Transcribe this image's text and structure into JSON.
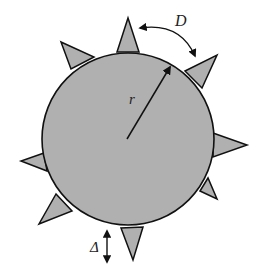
{
  "diagram": {
    "type": "spiked-sphere-schematic",
    "fill_color": "#b0b0b0",
    "stroke_color": "#111111",
    "background": "#ffffff",
    "circle": {
      "cx": 128,
      "cy": 139,
      "r": 86
    },
    "spikes": [
      {
        "name": "spike-top",
        "tip": [
          128,
          18
        ],
        "base": [
          [
            117,
            52
          ],
          [
            139,
            52
          ]
        ]
      },
      {
        "name": "spike-upper-left",
        "tip": [
          61,
          42
        ],
        "base": [
          [
            71,
            69
          ],
          [
            94,
            57
          ]
        ]
      },
      {
        "name": "spike-upper-right",
        "tip": [
          217,
          55
        ],
        "base": [
          [
            185,
            71
          ],
          [
            202,
            88
          ]
        ]
      },
      {
        "name": "spike-right",
        "tip": [
          247,
          145
        ],
        "base": [
          [
            213,
            133
          ],
          [
            213,
            157
          ]
        ]
      },
      {
        "name": "spike-left",
        "tip": [
          21,
          161
        ],
        "base": [
          [
            44,
            153
          ],
          [
            47,
            171
          ]
        ]
      },
      {
        "name": "spike-lower-right",
        "tip": [
          217,
          199
        ],
        "base": [
          [
            200,
            191
          ],
          [
            208,
            178
          ]
        ]
      },
      {
        "name": "spike-lower-left",
        "tip": [
          39,
          224
        ],
        "base": [
          [
            56,
            194
          ],
          [
            72,
            211
          ]
        ]
      },
      {
        "name": "spike-bottom",
        "tip": [
          133,
          260
        ],
        "base": [
          [
            121,
            228
          ],
          [
            143,
            227
          ]
        ]
      }
    ],
    "labels": {
      "radius": "r",
      "spacing": "D",
      "height": "Δ"
    }
  }
}
